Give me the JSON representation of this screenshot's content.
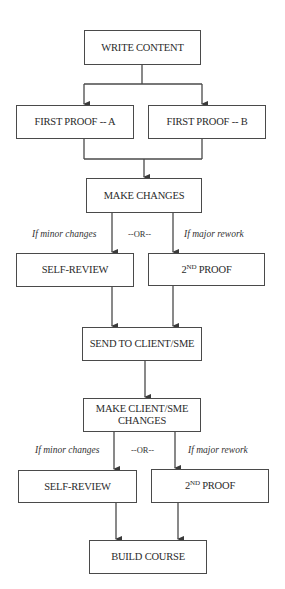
{
  "diagram": {
    "type": "flowchart",
    "nodes": {
      "write_content": "WRITE CONTENT",
      "first_proof_a": "FIRST PROOF -- A",
      "first_proof_b": "FIRST PROOF -- B",
      "make_changes": "MAKE CHANGES",
      "self_review_1": "SELF-REVIEW",
      "second_proof_1": {
        "base": "2",
        "sup": "ND",
        "rest": " PROOF"
      },
      "send_to_client": "SEND TO CLIENT/SME",
      "make_client_changes": "MAKE CLIENT/SME CHANGES",
      "self_review_2": "SELF-REVIEW",
      "second_proof_2": {
        "base": "2",
        "sup": "ND",
        "rest": " PROOF"
      },
      "build_course": "BUILD COURSE"
    },
    "labels": {
      "minor_1": "If minor changes",
      "or_1": "--OR--",
      "major_1": "If major rework",
      "minor_2": "If minor changes",
      "or_2": "--OR--",
      "major_2": "If major rework"
    },
    "edges": [
      [
        "write_content",
        "first_proof_a"
      ],
      [
        "write_content",
        "first_proof_b"
      ],
      [
        "first_proof_a",
        "make_changes"
      ],
      [
        "first_proof_b",
        "make_changes"
      ],
      [
        "make_changes",
        "self_review_1",
        "If minor changes"
      ],
      [
        "make_changes",
        "second_proof_1",
        "If major rework"
      ],
      [
        "self_review_1",
        "send_to_client"
      ],
      [
        "second_proof_1",
        "send_to_client"
      ],
      [
        "send_to_client",
        "make_client_changes"
      ],
      [
        "make_client_changes",
        "self_review_2",
        "If minor changes"
      ],
      [
        "make_client_changes",
        "second_proof_2",
        "If major rework"
      ],
      [
        "self_review_2",
        "build_course"
      ],
      [
        "second_proof_2",
        "build_course"
      ]
    ],
    "colors": {
      "line": "#4a4a4a",
      "text": "#2a2a2a",
      "background": "#ffffff"
    }
  }
}
